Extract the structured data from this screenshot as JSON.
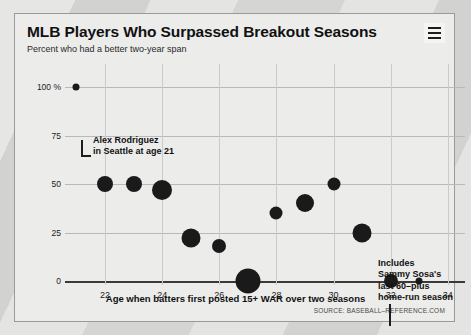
{
  "header": {
    "title": "MLB Players Who Surpassed Breakout Seasons",
    "subtitle": "Percent who had a better two-year span",
    "menu_icon": "hamburger-menu-icon"
  },
  "source": "SOURCE: BASEBALL–REFERENCE.COM",
  "annotations": [
    {
      "id": "alex-rodriguez",
      "text": "Alex Rodriguez\nin Seattle at age 21"
    },
    {
      "id": "sammy-sosa",
      "text": "Includes\nSammy Sosa's\nlast 60–plus\nhome-run season"
    }
  ],
  "chart_data": {
    "type": "scatter",
    "title": "MLB Players Who Surpassed Breakout Seasons",
    "subtitle": "Percent who had a better two-year span",
    "xlabel": "Age when batters first posted 15+ WAR over two seasons",
    "ylabel": "Percent who had a better two-year span",
    "xlim": [
      20.6,
      34.6
    ],
    "ylim": [
      0,
      100
    ],
    "grid": true,
    "legend": false,
    "xticks": [
      22,
      24,
      26,
      28,
      30,
      32,
      34
    ],
    "xtick_labels": [
      "22",
      "24",
      "26",
      "28",
      "30",
      "32",
      "34"
    ],
    "yticks": [
      0,
      25,
      50,
      75,
      100
    ],
    "ytick_labels": [
      "0",
      "25",
      "50",
      "75",
      "100 %"
    ],
    "marker_color": "#1a1a1a",
    "points": [
      {
        "x": 21,
        "y": 100,
        "size": 7
      },
      {
        "x": 22,
        "y": 50,
        "size": 16
      },
      {
        "x": 23,
        "y": 50,
        "size": 16
      },
      {
        "x": 24,
        "y": 47,
        "size": 20
      },
      {
        "x": 25,
        "y": 22,
        "size": 19
      },
      {
        "x": 26,
        "y": 18,
        "size": 14
      },
      {
        "x": 27,
        "y": 0,
        "size": 25
      },
      {
        "x": 28,
        "y": 35,
        "size": 13
      },
      {
        "x": 29,
        "y": 40,
        "size": 18
      },
      {
        "x": 30,
        "y": 50,
        "size": 13
      },
      {
        "x": 31,
        "y": 25,
        "size": 19
      },
      {
        "x": 32,
        "y": 0,
        "size": 14
      },
      {
        "x": 33,
        "y": 0,
        "size": 7
      }
    ]
  }
}
